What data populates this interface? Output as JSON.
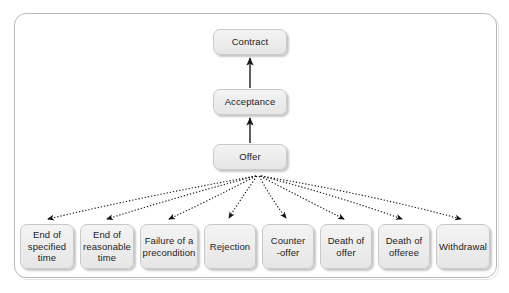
{
  "figure": {
    "caption": "",
    "frame": {
      "border_color": "#b8b8b8",
      "background": "#ffffff"
    },
    "style": {
      "node_fill": "#ececed",
      "node_border": "#c9c9c9",
      "text_color": "#1d1d1d",
      "solid_edge_color": "#1a1a1a",
      "dotted_edge_color": "#1a1a1a"
    }
  },
  "chain": {
    "nodes": [
      {
        "id": "contract",
        "label": "Contract"
      },
      {
        "id": "acceptance",
        "label": "Acceptance"
      },
      {
        "id": "offer",
        "label": "Offer"
      }
    ],
    "edges": [
      {
        "from": "acceptance",
        "to": "contract",
        "style": "solid",
        "direction": "up"
      },
      {
        "from": "offer",
        "to": "acceptance",
        "style": "solid",
        "direction": "up"
      }
    ]
  },
  "terminations": {
    "source": "offer",
    "edge_style": "dotted",
    "items": [
      {
        "id": "end-specified",
        "label": "End of\nspecified\ntime"
      },
      {
        "id": "end-reasonable",
        "label": "End of\nreasonable\ntime"
      },
      {
        "id": "failure",
        "label": "Failure of a\nprecondition"
      },
      {
        "id": "rejection",
        "label": "Rejection"
      },
      {
        "id": "counter-offer",
        "label": "Counter\n-offer"
      },
      {
        "id": "death-offeror",
        "label": "Death of\noffer"
      },
      {
        "id": "death-offeree",
        "label": "Death of\nofferee"
      },
      {
        "id": "withdrawal",
        "label": "Withdrawal"
      }
    ]
  }
}
